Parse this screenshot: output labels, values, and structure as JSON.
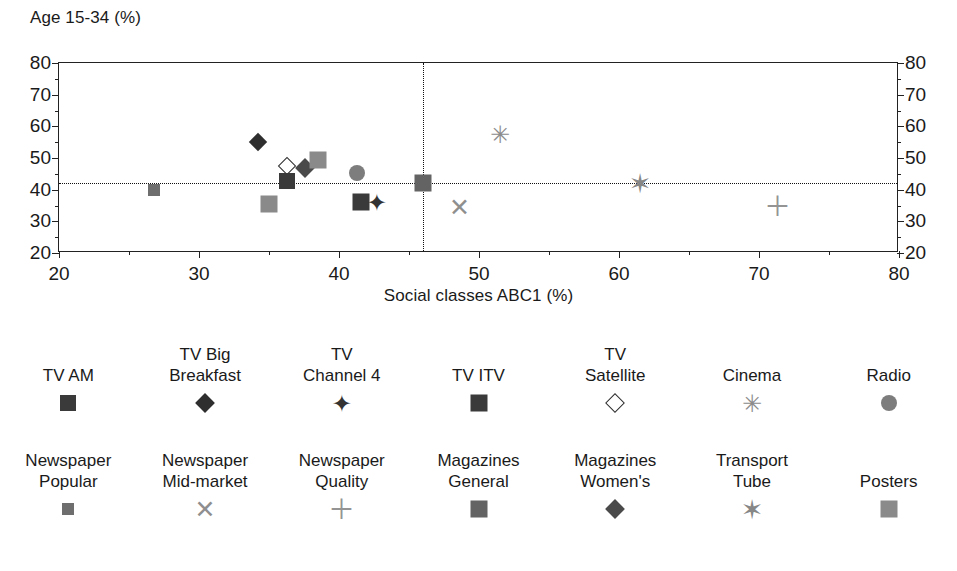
{
  "chart_data": {
    "type": "scatter",
    "title": "",
    "xlabel": "Social classes ABC1 (%)",
    "ylabel": "Age 15-34 (%)",
    "xlim": [
      20,
      80
    ],
    "ylim": [
      20,
      80
    ],
    "xticks": [
      20,
      30,
      40,
      50,
      60,
      70,
      80
    ],
    "yticks": [
      20,
      30,
      40,
      50,
      60,
      70,
      80
    ],
    "xticks_minor": [
      25,
      35,
      45,
      55,
      65,
      75
    ],
    "yticks_minor": [
      25,
      35,
      45,
      55,
      65,
      75
    ],
    "grid": false,
    "legend_position": "below",
    "reference_lines": {
      "horizontal": 42.0,
      "vertical": 46.0
    },
    "points": [
      {
        "series": "Newspaper Popular",
        "x": 26.8,
        "y": 40.0
      },
      {
        "series": "Posters",
        "x": 35.0,
        "y": 35.4
      },
      {
        "series": "TV Big Breakfast",
        "x": 34.2,
        "y": 55.2
      },
      {
        "series": "TV Satellite",
        "x": 36.3,
        "y": 47.6
      },
      {
        "series": "TV AM",
        "x": 36.3,
        "y": 42.6
      },
      {
        "series": "Magazines Women's",
        "x": 37.6,
        "y": 46.8
      },
      {
        "series": "Posters",
        "x": 38.5,
        "y": 49.4
      },
      {
        "series": "Radio",
        "x": 41.3,
        "y": 45.3
      },
      {
        "series": "TV ITV",
        "x": 41.6,
        "y": 36.0
      },
      {
        "series": "TV Channel 4",
        "x": 42.7,
        "y": 35.8
      },
      {
        "series": "Magazines General",
        "x": 46.0,
        "y": 42.0
      },
      {
        "series": "Newspaper Mid-market",
        "x": 48.6,
        "y": 34.5
      },
      {
        "series": "Cinema",
        "x": 51.5,
        "y": 57.5
      },
      {
        "series": "Transport Tube",
        "x": 61.5,
        "y": 41.8
      },
      {
        "series": "Newspaper Quality",
        "x": 71.3,
        "y": 34.7
      }
    ],
    "series_styles": [
      {
        "name": "TV AM",
        "marker": "square",
        "color": "#3a3a3a",
        "size": 16
      },
      {
        "name": "TV Big Breakfast",
        "marker": "diamond",
        "color": "#2e2e2e",
        "size": 13
      },
      {
        "name": "TV Channel 4",
        "marker": "star",
        "color": "#333333",
        "size": 19
      },
      {
        "name": "TV ITV",
        "marker": "square",
        "color": "#3a3a3a",
        "size": 17
      },
      {
        "name": "TV Satellite",
        "marker": "diamond-open",
        "color": "#2e2e2e",
        "size": 13
      },
      {
        "name": "Cinema",
        "marker": "asterisk",
        "color": "#8c8c8c",
        "size": 19
      },
      {
        "name": "Radio",
        "marker": "circle",
        "color": "#7d7d7d",
        "size": 16
      },
      {
        "name": "Newspaper Popular",
        "marker": "square",
        "color": "#6e6e6e",
        "size": 12
      },
      {
        "name": "Newspaper Mid-market",
        "marker": "cross",
        "color": "#8f8f8f",
        "size": 20
      },
      {
        "name": "Newspaper Quality",
        "marker": "plus",
        "color": "#949494",
        "size": 22
      },
      {
        "name": "Magazines General",
        "marker": "square",
        "color": "#636363",
        "size": 17
      },
      {
        "name": "Magazines Women's",
        "marker": "diamond",
        "color": "#4a4a4a",
        "size": 14
      },
      {
        "name": "Transport Tube",
        "marker": "star6",
        "color": "#878787",
        "size": 22
      },
      {
        "name": "Posters",
        "marker": "square",
        "color": "#8a8a8a",
        "size": 17
      }
    ]
  },
  "axes": {
    "y_title": "Age 15-34 (%)",
    "x_title": "Social classes ABC1 (%)",
    "y_labels": [
      "80",
      "70",
      "60",
      "50",
      "40",
      "30",
      "20"
    ],
    "y_labels_right": [
      "80",
      "70",
      "60",
      "50",
      "40",
      "30",
      "20"
    ],
    "x_labels": [
      "20",
      "30",
      "40",
      "50",
      "60",
      "70",
      "80"
    ]
  },
  "legend": {
    "row1": [
      {
        "label": "TV AM",
        "marker": "square",
        "color": "#3a3a3a",
        "size": 16
      },
      {
        "label": "TV Big\nBreakfast",
        "marker": "diamond",
        "color": "#2e2e2e",
        "size": 14
      },
      {
        "label": "TV\nChannel 4",
        "marker": "star",
        "color": "#333333",
        "size": 19
      },
      {
        "label": "TV ITV",
        "marker": "square",
        "color": "#3a3a3a",
        "size": 17
      },
      {
        "label": "TV\nSatellite",
        "marker": "diamond-open",
        "color": "#2e2e2e",
        "size": 14
      },
      {
        "label": "Cinema",
        "marker": "asterisk",
        "color": "#8c8c8c",
        "size": 19
      },
      {
        "label": "Radio",
        "marker": "circle",
        "color": "#7d7d7d",
        "size": 16
      }
    ],
    "row2": [
      {
        "label": "Newspaper\nPopular",
        "marker": "square",
        "color": "#6e6e6e",
        "size": 12
      },
      {
        "label": "Newspaper\nMid-market",
        "marker": "cross",
        "color": "#8f8f8f",
        "size": 20
      },
      {
        "label": "Newspaper\nQuality",
        "marker": "plus",
        "color": "#949494",
        "size": 22
      },
      {
        "label": "Magazines\nGeneral",
        "marker": "square",
        "color": "#636363",
        "size": 17
      },
      {
        "label": "Magazines\nWomen's",
        "marker": "diamond",
        "color": "#4a4a4a",
        "size": 14
      },
      {
        "label": "Transport\nTube",
        "marker": "star6",
        "color": "#878787",
        "size": 22
      },
      {
        "label": "Posters",
        "marker": "square",
        "color": "#8a8a8a",
        "size": 17
      }
    ]
  }
}
